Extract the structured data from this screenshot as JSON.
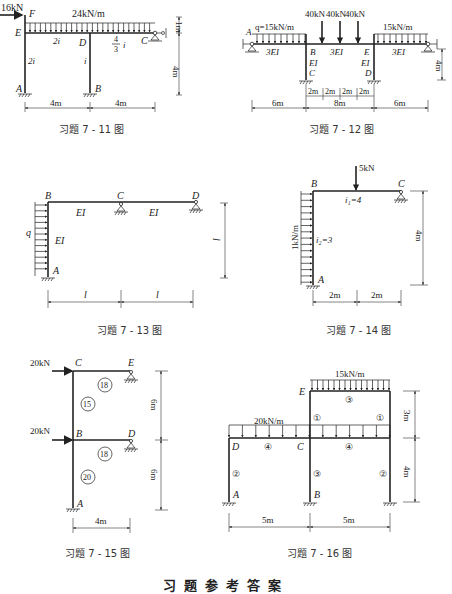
{
  "figures": [
    {
      "caption": "习题 7 - 11 图",
      "load_point": "16kN",
      "load_dist": "24kN/m",
      "nodes": {
        "F": "F",
        "E": "E",
        "D": "D",
        "C": "C",
        "A": "A",
        "B": "B"
      },
      "stiffness": {
        "ED": "2i",
        "EA": "2i",
        "DB": "i",
        "DC_num": "4",
        "DC_den": "3",
        "DC_sym": "i"
      },
      "dims": {
        "h_top": "1m",
        "h_main": "4m",
        "span1": "4m",
        "span2": "4m"
      }
    },
    {
      "caption": "习题 7 - 12 图",
      "load_left": "q=15kN/m",
      "load_right": "15kN/m",
      "point_loads": [
        "40kN",
        "40kN",
        "40kN"
      ],
      "nodes": {
        "A": "A",
        "B": "B",
        "C": "C",
        "E": "E",
        "D": "D"
      },
      "stiffness": {
        "AB": "3EI",
        "BE": "3EI",
        "ER": "3EI",
        "BC": "EI",
        "ED": "EI"
      },
      "dims": {
        "h": "4m",
        "left": "6m",
        "mid": "8m",
        "right": "6m",
        "sub": [
          "2m",
          "2m",
          "2m",
          "2m"
        ]
      }
    },
    {
      "caption": "习题 7 - 13 图",
      "load": "q",
      "nodes": {
        "B": "B",
        "C": "C",
        "D": "D",
        "A": "A"
      },
      "stiffness": {
        "BC": "EI",
        "CD": "EI",
        "AB": "EI"
      },
      "dims": {
        "h": "l",
        "span1": "l",
        "span2": "l"
      }
    },
    {
      "caption": "习题 7 - 14 图",
      "load_point": "5kN",
      "load_dist": "1kN/m",
      "nodes": {
        "B": "B",
        "C": "C",
        "A": "A"
      },
      "stiffness": {
        "BC": "i₁=4",
        "AB": "i₂=3"
      },
      "dims": {
        "h": "4m",
        "span1": "2m",
        "span2": "2m"
      }
    },
    {
      "caption": "习题 7 - 15 图",
      "loads": [
        "20kN",
        "20kN"
      ],
      "nodes": {
        "C": "C",
        "E": "E",
        "B": "B",
        "D": "D",
        "A": "A"
      },
      "stiffness": {
        "CE": "18",
        "BC": "15",
        "BD": "18",
        "AB": "20"
      },
      "dims": {
        "h1": "6m",
        "h2": "6m",
        "span": "4m"
      }
    },
    {
      "caption": "习题 7 - 16 图",
      "load_top": "15kN/m",
      "load_mid": "20kN/m",
      "nodes": {
        "E": "E",
        "D": "D",
        "C": "C",
        "A": "A",
        "B": "B"
      },
      "stiffness": {
        "top": "③",
        "col_upper_l": "①",
        "col_upper_r": "①",
        "beam_l": "④",
        "beam_r": "④",
        "col_a": "②",
        "col_b": "③",
        "col_r": "②"
      },
      "dims": {
        "h_top": "3m",
        "h_bot": "4m",
        "span1": "5m",
        "span2": "5m"
      }
    }
  ],
  "section_title": "习题参考答案"
}
